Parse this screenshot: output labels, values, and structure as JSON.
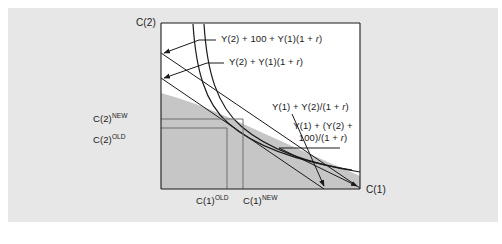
{
  "figure": {
    "name": "intertemporal-budget-constraint",
    "background_color": "#ffffff",
    "panel_color": "#e7e7e7",
    "plot_background": "#ffffff",
    "budget_set_fill": "#c6c6c6",
    "line_color": "#1a1a1a",
    "guide_line_color": "#6e6e6e"
  },
  "axes": {
    "y_axis_label": "C(2)",
    "x_axis_label": "C(1)"
  },
  "y_ticks": [
    {
      "label_prefix": "C(2)",
      "label_sup": "NEW",
      "name": "c2-new"
    },
    {
      "label_prefix": "C(2)",
      "label_sup": "OLD",
      "name": "c2-old"
    }
  ],
  "x_ticks": [
    {
      "label_prefix": "C(1)",
      "label_sup": "OLD",
      "name": "c1-old"
    },
    {
      "label_prefix": "C(1)",
      "label_sup": "NEW",
      "name": "c1-new"
    }
  ],
  "annotations": {
    "vertical_intercept_new": "Y(2) + 100 + Y(1)(1 + r)",
    "vertical_intercept_old": "Y(2) + Y(1)(1 + r)",
    "horizontal_intercept_old": "Y(1) + Y(2)/(1 + r)",
    "horizontal_intercept_new": "Y(1) + (Y(2) + 100)/(1 + r)"
  },
  "chart_data": {
    "type": "line",
    "title": "",
    "xlabel": "C(1)",
    "ylabel": "C(2)",
    "grid": false,
    "legend_position": "none",
    "xlim": [
      0,
      100
    ],
    "ylim": [
      0,
      100
    ],
    "series": [
      {
        "name": "old-budget-line",
        "kind": "budget-constraint",
        "description": "Original intertemporal budget line, vertical intercept Y(2) + Y(1)(1 + r), horizontal intercept Y(1) + Y(2)/(1 + r)",
        "x": [
          0,
          100
        ],
        "y": [
          75,
          0
        ]
      },
      {
        "name": "new-budget-line",
        "kind": "budget-constraint",
        "description": "New budget line after windfall of 100 in period 2, vertical intercept Y(2) + 100 + Y(1)(1 + r), horizontal intercept Y(1) + (Y(2) + 100)/(1 + r)",
        "x": [
          0,
          122
        ],
        "y": [
          92,
          0
        ]
      },
      {
        "name": "old-indifference-curve",
        "kind": "indifference-curve",
        "description": "Lower indifference curve tangent to the old budget line at the OLD optimum",
        "tangency_point": {
          "x": "C(1) OLD",
          "y": "C(2) OLD"
        }
      },
      {
        "name": "new-indifference-curve",
        "kind": "indifference-curve",
        "description": "Higher indifference curve tangent to the new budget line at the NEW optimum",
        "tangency_point": {
          "x": "C(1) NEW",
          "y": "C(2) NEW"
        }
      }
    ],
    "shaded_regions": [
      {
        "name": "feasible-budget-set",
        "fill": "#c6c6c6",
        "description": "Affordable consumption set under the new budget constraint"
      }
    ],
    "annotations": [
      {
        "text": "Y(2) + 100 + Y(1)(1 + r)",
        "points_to": "vertical-axis-intercept-new"
      },
      {
        "text": "Y(2) + Y(1)(1 + r)",
        "points_to": "vertical-axis-intercept-old"
      },
      {
        "text": "Y(1) + Y(2)/(1 + r)",
        "points_to": "horizontal-axis-intercept-old"
      },
      {
        "text": "Y(1) + (Y(2) + 100)/(1 + r)",
        "points_to": "horizontal-axis-intercept-new"
      }
    ]
  }
}
